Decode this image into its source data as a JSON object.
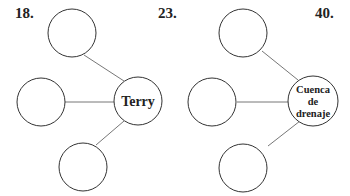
{
  "labels": {
    "q18": "18.",
    "q23": "23.",
    "q40": "40."
  },
  "diagrams": [
    {
      "center_text": [
        "Terry"
      ],
      "empty_nodes": 3
    },
    {
      "center_text": [
        "Cuenca",
        "de",
        "drenaje"
      ],
      "empty_nodes": 3
    }
  ],
  "colors": {
    "stroke": "#333333",
    "line": "#777777",
    "text": "#222222"
  }
}
